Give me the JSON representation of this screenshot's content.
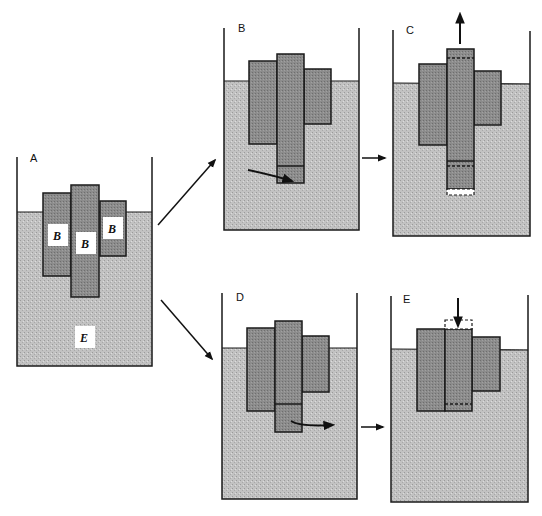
{
  "figure": {
    "panels": [
      {
        "id": "A",
        "label": "A",
        "block_label": "B",
        "fluid_label": "E"
      },
      {
        "id": "B",
        "label": "B"
      },
      {
        "id": "C",
        "label": "C"
      },
      {
        "id": "D",
        "label": "D"
      },
      {
        "id": "E",
        "label": "E"
      }
    ],
    "colors": {
      "fluid": "#bdbdbd",
      "block": "#8e8e8e",
      "outline": "#1a1a1a",
      "background": "#ffffff"
    }
  }
}
